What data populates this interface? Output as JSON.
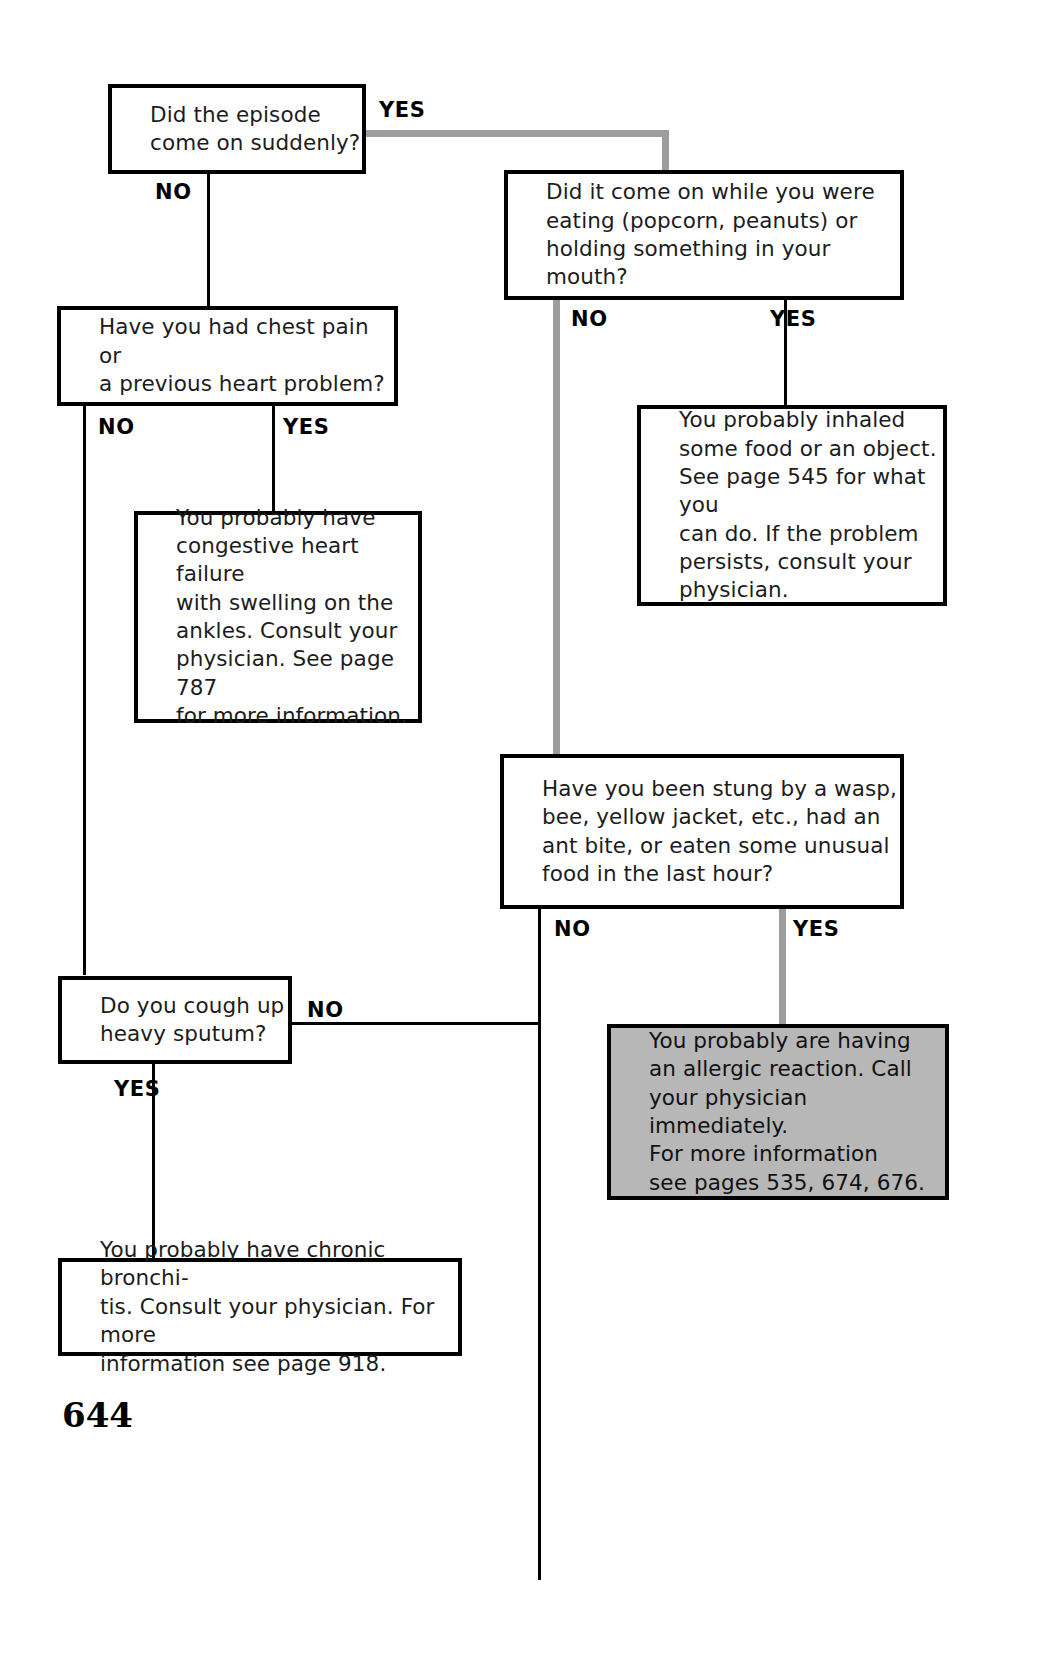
{
  "document": {
    "page_number": "644",
    "type": "medical-symptom-decision-flowchart",
    "colors": {
      "ink": "#000000",
      "highlight_path": "#9d9d9d",
      "shaded_box_fill": "#b7b7b7",
      "page_background": "#ffffff"
    }
  },
  "nodes": {
    "q_sudden": {
      "id": "q1",
      "kind": "question",
      "text": "Did the episode\ncome on suddenly?"
    },
    "q_chest_pain": {
      "id": "q2",
      "kind": "question",
      "text": "Have you had chest pain or\na previous heart problem?"
    },
    "q_eating": {
      "id": "q3",
      "kind": "question",
      "text": "Did it come on while you were\neating (popcorn, peanuts) or\nholding something in your mouth?"
    },
    "q_stung": {
      "id": "q4",
      "kind": "question",
      "text": "Have you been stung by a wasp,\nbee, yellow jacket, etc., had an\nant bite, or eaten some unusual\nfood in the last hour?"
    },
    "q_sputum": {
      "id": "q5",
      "kind": "question",
      "text": "Do you cough up\nheavy sputum?"
    },
    "a_heart_failure": {
      "id": "a1",
      "kind": "answer",
      "text": "You probably have\ncongestive heart failure\nwith swelling on the\nankles. Consult your\nphysician. See page 787\nfor more information."
    },
    "a_inhaled": {
      "id": "a2",
      "kind": "answer",
      "text": "You probably inhaled\nsome food or an object.\nSee page 545 for what you\ncan do. If the problem\npersists, consult your\nphysician."
    },
    "a_allergic": {
      "id": "a3",
      "kind": "answer-highlighted",
      "text": "You probably are having\nan allergic reaction. Call\nyour physician immediately.\nFor more information\nsee pages 535, 674, 676."
    },
    "a_bronchitis": {
      "id": "a4",
      "kind": "answer",
      "text": "You probably have chronic bronchi-\ntis. Consult your physician. For more\ninformation see page 918."
    }
  },
  "edges": {
    "q_sudden_no": "NO",
    "q_sudden_yes": "YES",
    "q_chest_no": "NO",
    "q_chest_yes": "YES",
    "q_eating_no": "NO",
    "q_eating_yes": "YES",
    "q_stung_no": "NO",
    "q_stung_yes": "YES",
    "q_sputum_no": "NO",
    "q_sputum_yes": "YES"
  }
}
